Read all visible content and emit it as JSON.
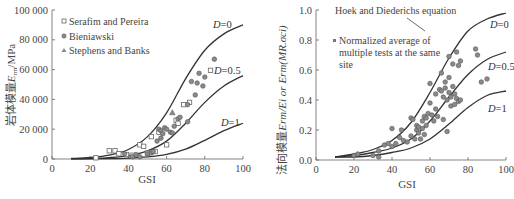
{
  "chart_data": [
    {
      "type": "scatter",
      "title": "",
      "xlabel": "GSI",
      "ylabel": "岩体模量E_rm/MPa",
      "xlim": [
        0,
        100
      ],
      "ylim": [
        0,
        100000
      ],
      "xticks": [
        "0",
        "20",
        "40",
        "60",
        "80",
        "100"
      ],
      "yticks": [
        "0",
        "20 000",
        "40 000",
        "60 000",
        "80 000",
        "100 000"
      ],
      "grid": false,
      "legend_position": "upper-left",
      "legend": [
        "Serafim and Pereira",
        "Bieniawski",
        "Stephens and Banks"
      ],
      "curve_labels": [
        "D=0",
        "D=0.5",
        "D=1"
      ],
      "curves": [
        {
          "name": "D=0",
          "x": [
            10,
            20,
            30,
            40,
            50,
            60,
            70,
            80,
            90,
            100
          ],
          "y": [
            390,
            1000,
            2600,
            6400,
            15000,
            31000,
            54000,
            73000,
            84000,
            90000
          ]
        },
        {
          "name": "D=0.5",
          "x": [
            10,
            20,
            30,
            40,
            50,
            60,
            70,
            80,
            90,
            100
          ],
          "y": [
            140,
            360,
            930,
            2300,
            5500,
            12000,
            24000,
            38000,
            49000,
            56000
          ]
        },
        {
          "name": "D=1",
          "x": [
            10,
            20,
            30,
            40,
            50,
            60,
            70,
            80,
            90,
            100
          ],
          "y": [
            40,
            100,
            250,
            600,
            1400,
            3100,
            6600,
            12500,
            19000,
            24000
          ]
        }
      ],
      "series": [
        {
          "name": "Serafim and Pereira",
          "marker": "square",
          "x": [
            23,
            30,
            33,
            35,
            39,
            42,
            46,
            48,
            50,
            52,
            54,
            56,
            60,
            65,
            66,
            69,
            72,
            83
          ],
          "y": [
            800,
            5500,
            5500,
            3500,
            3000,
            2500,
            9500,
            8500,
            4000,
            15000,
            5000,
            18000,
            9500,
            26000,
            24000,
            36500,
            38000,
            59500
          ]
        },
        {
          "name": "Bieniawski",
          "marker": "circle",
          "x": [
            38,
            42,
            44,
            46,
            50,
            52,
            53,
            55,
            56,
            57,
            57,
            58,
            59,
            60,
            62,
            63,
            64,
            66,
            67,
            71,
            71,
            73,
            75,
            76,
            77,
            79,
            80,
            85
          ],
          "y": [
            3500,
            1500,
            3000,
            1500,
            3500,
            4000,
            5000,
            12000,
            20000,
            14000,
            19000,
            17000,
            21000,
            20000,
            18000,
            17500,
            22000,
            27000,
            28000,
            25000,
            36500,
            52000,
            43000,
            51000,
            57500,
            49000,
            55000,
            67000
          ]
        },
        {
          "name": "Stephens and Banks",
          "marker": "triangle",
          "x": [
            63
          ],
          "y": [
            31000
          ]
        }
      ]
    },
    {
      "type": "scatter",
      "title": "",
      "xlabel": "GSI",
      "ylabel": "法向模量E_rm/E_i or E_rm(MR.σ_ci)",
      "xlim": [
        0,
        100
      ],
      "ylim": [
        0.0,
        1.0
      ],
      "xticks": [
        "0",
        "20",
        "40",
        "60",
        "80",
        "100"
      ],
      "yticks": [
        "0.0",
        "0.2",
        "0.4",
        "0.6",
        "0.8",
        "1.0"
      ],
      "grid": false,
      "legend_position": "upper-left",
      "legend": [
        "Normalized average of multiple tests at the same site"
      ],
      "annotation": "Hoek and Diederichs equation",
      "curve_labels": [
        "D=0",
        "D=0.5",
        "D=1"
      ],
      "curves": [
        {
          "name": "D=0",
          "x": [
            10,
            20,
            30,
            40,
            50,
            60,
            70,
            80,
            90,
            100
          ],
          "y": [
            0.02,
            0.04,
            0.07,
            0.13,
            0.25,
            0.45,
            0.68,
            0.86,
            0.94,
            0.98
          ]
        },
        {
          "name": "D=0.5",
          "x": [
            10,
            20,
            30,
            40,
            50,
            60,
            70,
            80,
            90,
            100
          ],
          "y": [
            0.02,
            0.03,
            0.05,
            0.08,
            0.14,
            0.26,
            0.42,
            0.57,
            0.67,
            0.72
          ]
        },
        {
          "name": "D=1",
          "x": [
            10,
            20,
            30,
            40,
            50,
            60,
            70,
            80,
            90,
            100
          ],
          "y": [
            0.02,
            0.02,
            0.03,
            0.05,
            0.08,
            0.14,
            0.24,
            0.35,
            0.43,
            0.46
          ]
        }
      ],
      "series": [
        {
          "name": "Normalized average of multiple tests at the same site",
          "marker": "circle",
          "x": [
            20,
            22,
            30,
            33,
            33,
            36,
            38,
            40,
            40,
            42,
            44,
            45,
            46,
            48,
            50,
            50,
            51,
            52,
            53,
            53,
            54,
            54,
            55,
            56,
            56,
            57,
            57,
            58,
            58,
            59,
            60,
            60,
            61,
            62,
            63,
            63,
            64,
            65,
            66,
            66,
            67,
            67,
            68,
            68,
            69,
            69,
            70,
            70,
            70,
            71,
            71,
            72,
            72,
            73,
            73,
            74,
            74,
            75,
            75,
            76,
            76,
            84,
            85,
            87,
            90
          ],
          "y": [
            0.03,
            0.04,
            0.03,
            0.06,
            0.02,
            0.1,
            0.11,
            0.21,
            0.09,
            0.11,
            0.15,
            0.2,
            0.13,
            0.12,
            0.28,
            0.16,
            0.27,
            0.14,
            0.2,
            0.23,
            0.18,
            0.22,
            0.14,
            0.26,
            0.21,
            0.29,
            0.17,
            0.28,
            0.23,
            0.31,
            0.51,
            0.38,
            0.3,
            0.26,
            0.44,
            0.34,
            0.29,
            0.47,
            0.58,
            0.46,
            0.42,
            0.27,
            0.52,
            0.48,
            0.19,
            0.4,
            0.69,
            0.55,
            0.45,
            0.36,
            0.42,
            0.49,
            0.64,
            0.37,
            0.44,
            0.72,
            0.41,
            0.63,
            0.39,
            0.66,
            0.4,
            0.74,
            0.7,
            0.52,
            0.54
          ]
        }
      ]
    }
  ],
  "left_panel": {
    "legend": {
      "items": [
        {
          "label": "Serafim and Pereira",
          "marker": "square"
        },
        {
          "label": "Bieniawski",
          "marker": "circle"
        },
        {
          "label": "Stephens and Banks",
          "marker": "triangle"
        }
      ]
    },
    "ylabel_cn": "岩体模量",
    "ylabel_sym": "E",
    "ylabel_sub": "rm",
    "ylabel_unit": "/MPa",
    "xlabel": "GSI",
    "curve_labels": [
      {
        "d": "D",
        "v": "=0"
      },
      {
        "d": "D",
        "v": "=0.5"
      },
      {
        "d": "D",
        "v": "=1"
      }
    ]
  },
  "right_panel": {
    "legend": {
      "line1": "Normalized average of",
      "line2": "multiple tests at the same",
      "line3": "site"
    },
    "annotation": "Hoek and Diederichs equation",
    "ylabel_cn": "法向模量",
    "ylabel_rest": "E",
    "ylabel_tail": "rm/Ei or Erm(MR.σci)",
    "xlabel": "GSI",
    "curve_labels": [
      {
        "d": "D",
        "v": "=0"
      },
      {
        "d": "D",
        "v": "=0.5"
      },
      {
        "d": "D",
        "v": "=1"
      }
    ]
  },
  "colors": {
    "axis": "#666666",
    "curve": "#333333",
    "marker_fill": "#8a8a8a",
    "marker_stroke": "#555555",
    "text": "#444444"
  }
}
